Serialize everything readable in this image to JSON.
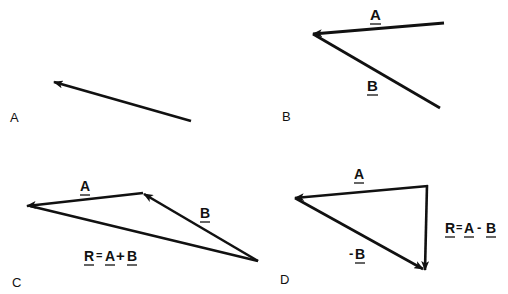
{
  "diagram": {
    "colors": {
      "stroke": "#111111",
      "background": "#ffffff"
    },
    "panels": [
      {
        "id": "A",
        "label": "A",
        "vectors": [
          {
            "name": "A",
            "from": [
              191,
              121
            ],
            "to": [
              54,
              82
            ]
          }
        ]
      },
      {
        "id": "B",
        "label": "B",
        "vectors": [
          {
            "name": "A",
            "label": "A",
            "from": [
              444,
              23
            ],
            "to": [
              313,
              34
            ]
          },
          {
            "name": "B",
            "label": "B",
            "from": [
              440,
              108
            ],
            "to": [
              313,
              34
            ]
          }
        ]
      },
      {
        "id": "C",
        "label": "C",
        "vectors": [
          {
            "name": "A",
            "label": "A",
            "from": [
              143,
              193
            ],
            "to": [
              27,
              206
            ]
          },
          {
            "name": "B",
            "label": "B",
            "from": [
              258,
              261
            ],
            "to": [
              143,
              193
            ]
          },
          {
            "name": "R",
            "from": [
              258,
              261
            ],
            "to": [
              27,
              206
            ]
          }
        ],
        "equation": {
          "r": "R",
          "eq": "=",
          "a": "A",
          "op": "+",
          "b": "B"
        }
      },
      {
        "id": "D",
        "label": "D",
        "vectors": [
          {
            "name": "A",
            "label": "A",
            "from": [
              427,
              186
            ],
            "to": [
              295,
              198
            ]
          },
          {
            "name": "R",
            "from": [
              427,
              186
            ],
            "to": [
              425,
              270
            ]
          },
          {
            "name": "-B",
            "label": "-B",
            "from": [
              295,
              198
            ],
            "to": [
              425,
              270
            ]
          }
        ],
        "equation": {
          "r": "R",
          "eq": "=",
          "a": "A",
          "op": "-",
          "b": "B"
        }
      }
    ],
    "texts": {
      "panelA": "A",
      "panelB": "B",
      "panelC": "C",
      "panelD": "D",
      "bA": "A",
      "bB": "B",
      "cA": "A",
      "cB": "B",
      "cR": "R",
      "cEq": "=",
      "cEqA": "A",
      "cPlus": "+",
      "cEqB": "B",
      "dA": "A",
      "dMinusSign": "-",
      "dB": "B",
      "dR": "R",
      "dEq": "=",
      "dEqA": "A",
      "dMinus": "-",
      "dEqB": "B"
    }
  }
}
